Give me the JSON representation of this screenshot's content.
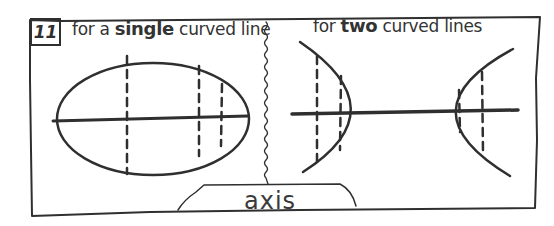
{
  "panel": {
    "number": "11",
    "left_caption": {
      "prefix": "for a ",
      "emphasis": "single",
      "suffix": " curved line"
    },
    "right_caption": {
      "prefix": "for ",
      "emphasis": "two",
      "suffix": " curved lines"
    },
    "axis_label": "axis"
  },
  "figures": {
    "left": {
      "shape": "ellipse",
      "axis": "horizontal",
      "dashed_chords": 3
    },
    "right": {
      "shape": "hyperbola",
      "branches": 2,
      "axis": "horizontal",
      "dashed_chords_per_branch": 2
    }
  },
  "colors": {
    "ink": "#2f2f2f",
    "background": "#ffffff"
  }
}
